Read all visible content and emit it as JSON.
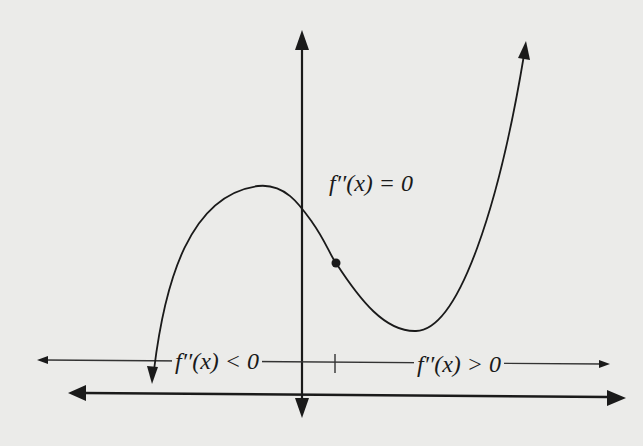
{
  "diagram": {
    "title": "",
    "labels": {
      "inflection": "f′′(x) = 0",
      "concave_down": "f′′(x) < 0",
      "concave_up": "f′′(x) > 0"
    },
    "elements": {
      "curve": "cubic curve with local maximum left of y-axis and local minimum right of inflection point",
      "inflection_point": "filled dot on curve where concavity changes",
      "number_line": "second-derivative sign line with tick mark at inflection x",
      "axes": "x-axis and y-axis with arrowheads"
    },
    "colors": {
      "ink": "#1a1a1a",
      "background": "#ebebe9"
    }
  }
}
